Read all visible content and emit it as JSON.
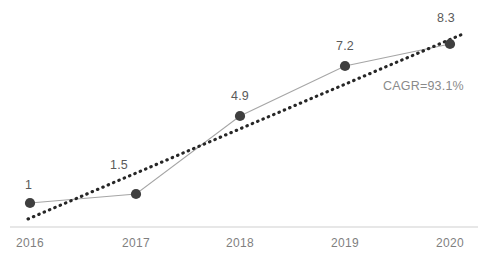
{
  "chart_data": {
    "type": "line",
    "title": "",
    "subtitle": "",
    "xlabel": "",
    "ylabel": "",
    "grid": false,
    "legend": "none",
    "categories": [
      "2016",
      "2017",
      "2018",
      "2019",
      "2020"
    ],
    "tick_labels": [
      "2016",
      "2017",
      "2018",
      "2019",
      "2020"
    ],
    "series": [
      {
        "name": "value",
        "values": [
          1,
          1.5,
          4.9,
          7.2,
          8.3
        ],
        "point_labels": [
          "1",
          "1.5",
          "4.9",
          "7.2",
          "8.3"
        ],
        "marker": "circle",
        "marker_color": "#3f3f3f",
        "line_color": "#a6a6a6",
        "line_style": "solid"
      },
      {
        "name": "trendline",
        "line_style": "dotted",
        "line_color": "#262626",
        "start": {
          "x": 2016,
          "y": 0.62
        },
        "end": {
          "x": 2020,
          "y": 8.75
        }
      }
    ],
    "annotations": [
      {
        "text": "CAGR=93.1%",
        "name": "cagr-annotation"
      }
    ],
    "xlim": [
      2016,
      2020
    ],
    "ylim": [
      0,
      9.2
    ],
    "axis_line_color": "#d0d0d0",
    "label_color": "#5a5a5a",
    "tick_color": "#7f7f7f"
  },
  "geometry": {
    "points": [
      {
        "cx": 30,
        "cy": 203,
        "label_x": 25,
        "label_y": 178,
        "tick_x": 30,
        "tick_y": 236
      },
      {
        "cx": 136,
        "cy": 194,
        "label_x": 110,
        "label_y": 158,
        "tick_x": 136,
        "tick_y": 236
      },
      {
        "cx": 240,
        "cy": 116,
        "label_x": 231,
        "label_y": 89,
        "tick_x": 240,
        "tick_y": 236
      },
      {
        "cx": 345,
        "cy": 66,
        "label_x": 336,
        "label_y": 39,
        "tick_x": 345,
        "tick_y": 236
      },
      {
        "cx": 450,
        "cy": 44,
        "label_x": 437,
        "label_y": 11,
        "tick_x": 450,
        "tick_y": 236
      }
    ],
    "trendline": {
      "x1": 28,
      "y1": 219,
      "x2": 463,
      "y2": 34
    },
    "axis": {
      "x1": 10,
      "y1": 227,
      "x2": 478,
      "y2": 227
    },
    "cagr": {
      "x": 383,
      "y": 79
    }
  }
}
